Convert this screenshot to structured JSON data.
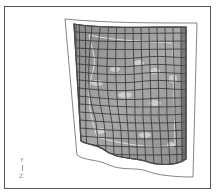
{
  "viewport": {
    "title": "",
    "background": "#ffffff",
    "border_color": "#555555"
  },
  "mesh": {
    "description": "deformed surface mesh with grid lines",
    "fill_color": "#9a9a9a",
    "grid_color": "#3c3c3c",
    "outline_color": "#666666",
    "highlight_color": "#e6e6e6",
    "grid_rows": 16,
    "grid_cols": 14
  },
  "axis_triad": {
    "labels": [
      "Y",
      "Z"
    ]
  }
}
